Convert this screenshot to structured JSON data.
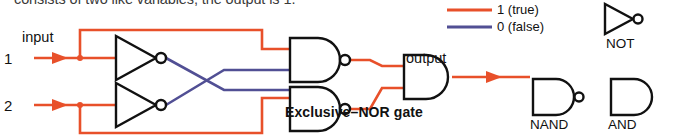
{
  "page": {
    "clipped_heading": "consists of two like variables, the output is 1.",
    "background": "#ffffff"
  },
  "colors": {
    "true_wire": "#e8502a",
    "false_wire": "#514f94",
    "gate_stroke": "#111111",
    "text": "#111111"
  },
  "circuit": {
    "title": "Exclusive–NOR gate",
    "input_label": "input",
    "input_1": "1",
    "input_2": "2",
    "output_label": "output",
    "gates": [
      {
        "name": "not-gate-top",
        "type": "NOT"
      },
      {
        "name": "not-gate-bottom",
        "type": "NOT"
      },
      {
        "name": "nand-gate-top",
        "type": "NAND"
      },
      {
        "name": "nand-gate-bottom",
        "type": "NAND"
      },
      {
        "name": "and-gate-output",
        "type": "AND"
      }
    ]
  },
  "legend": {
    "entries": [
      {
        "value": "1",
        "label": "1 (true)",
        "color": "#e8502a"
      },
      {
        "value": "0",
        "label": "0 (false)",
        "color": "#514f94"
      }
    ]
  },
  "gate_key": {
    "not": "NOT",
    "nand": "NAND",
    "and": "AND"
  }
}
